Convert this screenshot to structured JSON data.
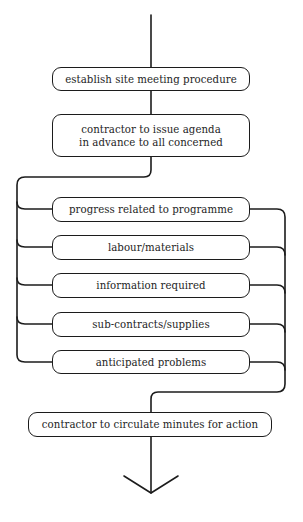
{
  "diagram": {
    "type": "flowchart",
    "stroke_color": "#1c1c1c",
    "background": "#ffffff",
    "start_step": "establish site meeting procedure",
    "step2": "contractor to issue agenda\nin advance to all concerned",
    "agenda_items": [
      "progress related to programme",
      "labour/materials",
      "information required",
      "sub-contracts/supplies",
      "anticipated problems"
    ],
    "final_step": "contractor to circulate minutes for action",
    "end_marker": "arrow-down"
  }
}
